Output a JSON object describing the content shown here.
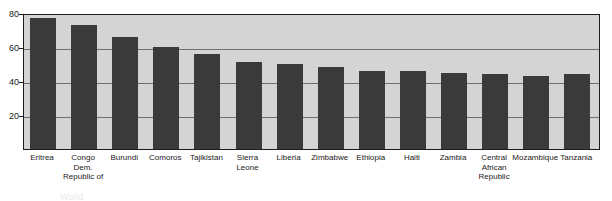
{
  "chart_data": {
    "type": "bar",
    "title": "",
    "xlabel": "",
    "ylabel": "",
    "ylim": [
      0,
      80
    ],
    "yticks": [
      20,
      40,
      60,
      80
    ],
    "grid": true,
    "legend": null,
    "bar_color": "#3a3a3a",
    "plot_background": "#d4d4d4",
    "categories": [
      "Eritrea",
      "Congo Dem. Republic of",
      "Burundi",
      "Comoros",
      "Tajikistan",
      "Sierra Leone",
      "Liberia",
      "Zimbabwe",
      "Ethiopia",
      "Haiti",
      "Zambia",
      "Central African Republic",
      "Mozambique",
      "Tanzania"
    ],
    "category_lines": [
      [
        "Eritrea"
      ],
      [
        "Congo",
        "Dem.",
        "Republic of"
      ],
      [
        "Burundi"
      ],
      [
        "Comoros"
      ],
      [
        "Tajikistan"
      ],
      [
        "Sierra",
        "Leone"
      ],
      [
        "Liberia"
      ],
      [
        "Zimbabwe"
      ],
      [
        "Ethiopia"
      ],
      [
        "Haiti"
      ],
      [
        "Zambia"
      ],
      [
        "Central",
        "African",
        "Republic"
      ],
      [
        "Mozambique"
      ],
      [
        "Tanzania"
      ]
    ],
    "values": [
      77,
      73,
      66,
      60,
      56,
      51,
      50,
      48,
      46,
      46,
      45,
      44,
      43,
      44
    ]
  },
  "caption": {
    "text": "World"
  }
}
